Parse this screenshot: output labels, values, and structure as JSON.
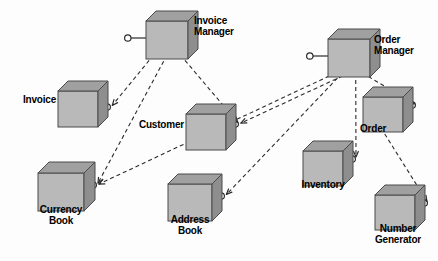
{
  "diagram": {
    "kind": "uml-component-diagram",
    "canvas": {
      "width": 438,
      "height": 261,
      "background": "#fdfdfd"
    },
    "colors": {
      "cube_front": "#b9b9b9",
      "cube_top": "#a0a0a0",
      "cube_side": "#8e8e8e",
      "cube_outline": "#4a4a4a",
      "edge": "#2b2b2b",
      "text": "#000000",
      "lollipop_fill": "#ffffff"
    },
    "components": [
      {
        "id": "invoice-manager",
        "label": "Invoice\nManager",
        "label_lines": [
          "Invoice",
          "Manager"
        ],
        "cube": {
          "x": 146,
          "y": 11,
          "w": 42,
          "h": 38,
          "depth": 10
        },
        "label_pos": {
          "x": 194,
          "y": 16,
          "w": 62,
          "align": "left"
        },
        "interface_port": {
          "x": 131,
          "y": 38,
          "side": "left"
        }
      },
      {
        "id": "order-manager",
        "label": "Order\nManager",
        "label_lines": [
          "Order",
          "Manager"
        ],
        "cube": {
          "x": 328,
          "y": 29,
          "w": 42,
          "h": 38,
          "depth": 10
        },
        "label_pos": {
          "x": 374,
          "y": 35,
          "w": 62,
          "align": "left"
        },
        "interface_port": {
          "x": 313,
          "y": 56,
          "side": "left"
        }
      },
      {
        "id": "invoice",
        "label": "Invoice",
        "label_lines": [
          "Invoice"
        ],
        "cube": {
          "x": 58,
          "y": 81,
          "w": 40,
          "h": 36,
          "depth": 10
        },
        "label_pos": {
          "x": 8,
          "y": 95,
          "w": 48,
          "align": "right"
        },
        "interface_port": {
          "x": 104,
          "y": 107,
          "side": "right"
        }
      },
      {
        "id": "customer",
        "label": "Customer",
        "label_lines": [
          "Customer"
        ],
        "cube": {
          "x": 186,
          "y": 104,
          "w": 40,
          "h": 36,
          "depth": 10
        },
        "label_pos": {
          "x": 128,
          "y": 120,
          "w": 56,
          "align": "right"
        },
        "interface_port": {
          "x": 232,
          "y": 124,
          "side": "right"
        }
      },
      {
        "id": "order",
        "label": "Order",
        "label_lines": [
          "Order"
        ],
        "cube": {
          "x": 363,
          "y": 87,
          "w": 40,
          "h": 35,
          "depth": 10
        },
        "label_pos": {
          "x": 360,
          "y": 124,
          "w": 46,
          "align": "left"
        },
        "interface_port": {
          "x": 409,
          "y": 105,
          "side": "right"
        }
      },
      {
        "id": "currency-book",
        "label": "Currency\nBook",
        "label_lines": [
          "Currency",
          "Book"
        ],
        "cube": {
          "x": 38,
          "y": 162,
          "w": 46,
          "h": 38,
          "depth": 11
        },
        "label_pos": {
          "x": 26,
          "y": 205,
          "w": 70,
          "align": "center"
        },
        "interface_port": {
          "x": 90,
          "y": 185,
          "side": "right"
        }
      },
      {
        "id": "address-book",
        "label": "Address\nBook",
        "label_lines": [
          "Address",
          "Book"
        ],
        "cube": {
          "x": 168,
          "y": 174,
          "w": 44,
          "h": 37,
          "depth": 10
        },
        "label_pos": {
          "x": 156,
          "y": 215,
          "w": 68,
          "align": "center"
        },
        "interface_port": {
          "x": 218,
          "y": 196,
          "side": "right"
        }
      },
      {
        "id": "inventory",
        "label": "Inventory",
        "label_lines": [
          "Inventory"
        ],
        "cube": {
          "x": 303,
          "y": 141,
          "w": 40,
          "h": 35,
          "depth": 10
        },
        "label_pos": {
          "x": 288,
          "y": 180,
          "w": 70,
          "align": "center"
        },
        "interface_port": {
          "x": 349,
          "y": 159,
          "side": "right"
        }
      },
      {
        "id": "number-generator",
        "label": "Number\nGenerator",
        "label_lines": [
          "Number",
          "Generator"
        ],
        "cube": {
          "x": 375,
          "y": 185,
          "w": 40,
          "h": 35,
          "depth": 10
        },
        "label_pos": {
          "x": 360,
          "y": 224,
          "w": 76,
          "align": "center"
        },
        "interface_port": {
          "x": 421,
          "y": 203,
          "side": "right"
        }
      }
    ],
    "dependencies": [
      {
        "from": "invoice-manager",
        "to": "invoice",
        "style": "dashed-arrow"
      },
      {
        "from": "invoice-manager",
        "to": "currency-book",
        "style": "dashed-arrow"
      },
      {
        "from": "invoice-manager",
        "to": "customer",
        "style": "dashed-arrow"
      },
      {
        "from": "order-manager",
        "to": "currency-book",
        "style": "dashed-arrow"
      },
      {
        "from": "order-manager",
        "to": "address-book",
        "style": "dashed-arrow"
      },
      {
        "from": "order-manager",
        "to": "customer",
        "style": "dashed-arrow"
      },
      {
        "from": "order-manager",
        "to": "inventory",
        "style": "dashed-arrow"
      },
      {
        "from": "order-manager",
        "to": "order",
        "style": "dashed-arrow"
      },
      {
        "from": "order",
        "to": "number-generator",
        "style": "dashed-arrow"
      }
    ]
  }
}
